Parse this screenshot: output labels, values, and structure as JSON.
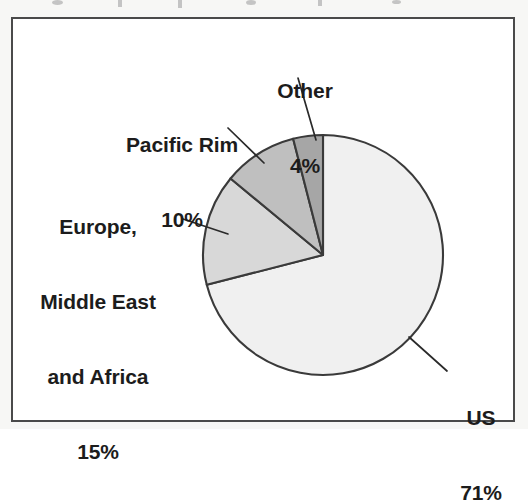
{
  "figure": {
    "background_color": "#f7f7f5",
    "frame_color": "#4a4a4a",
    "plot_background": "#ffffff"
  },
  "chart_data": {
    "type": "pie",
    "title": "",
    "subtitle": "",
    "xlabel": "",
    "ylabel": "",
    "legend_position": "none",
    "grid": false,
    "units": "percent",
    "start_angle_deg": 0,
    "direction": "clockwise",
    "categories": [
      "US",
      "Europe, Middle East and Africa",
      "Pacific Rim",
      "Other"
    ],
    "values": [
      71,
      15,
      10,
      4
    ],
    "value_labels": [
      "71%",
      "15%",
      "10%",
      "4%"
    ],
    "slices": [
      {
        "name": "US",
        "label_lines": [
          "US",
          "71%"
        ],
        "value": 71,
        "value_label": "71%",
        "color": "#f0f0f0",
        "edge_color": "#3a3a3a"
      },
      {
        "name": "Europe, Middle East and Africa",
        "label_lines": [
          "Europe,",
          "Middle East",
          "and Africa",
          "15%"
        ],
        "value": 15,
        "value_label": "15%",
        "color": "#d8d8d8",
        "edge_color": "#3a3a3a"
      },
      {
        "name": "Pacific Rim",
        "label_lines": [
          "Pacific Rim",
          "10%"
        ],
        "value": 10,
        "value_label": "10%",
        "color": "#bfbfbf",
        "edge_color": "#3a3a3a"
      },
      {
        "name": "Other",
        "label_lines": [
          "Other",
          "4%"
        ],
        "value": 4,
        "value_label": "4%",
        "color": "#a6a6a6",
        "edge_color": "#3a3a3a"
      }
    ],
    "geometry": {
      "center_x": 323,
      "center_y": 255,
      "radius": 120
    }
  },
  "labels": {
    "other": {
      "line1": "Other",
      "line2": "4%"
    },
    "pacific_rim": {
      "line1": "Pacific Rim",
      "line2": "10%"
    },
    "emea": {
      "line1": "Europe,",
      "line2": "Middle East",
      "line3": "and Africa",
      "line4": "15%"
    },
    "us": {
      "line1": "US",
      "line2": "71%"
    }
  }
}
